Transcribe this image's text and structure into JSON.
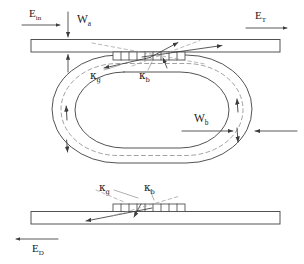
{
  "figure": {
    "kind": "optical-ring-resonator-schematic",
    "stroke_color": "#3c3c3c",
    "fill_color": "#ffffff",
    "background": "#ffffff"
  },
  "labels": {
    "input_field": {
      "base": "E",
      "sub": "in"
    },
    "through_field": {
      "base": "E",
      "sub": "T"
    },
    "drop_field": {
      "base": "E",
      "sub": "D"
    },
    "width_bus": {
      "base": "W",
      "sub": "a"
    },
    "width_ring": {
      "base": "W",
      "sub": "b"
    },
    "kappa_grating_top": {
      "base": "κ",
      "sub": "g"
    },
    "kappa_bus_top": {
      "base": "κ",
      "sub": "b"
    },
    "kappa_grating_bottom": {
      "base": "κ",
      "sub": "g"
    },
    "kappa_bus_bottom": {
      "base": "κ",
      "sub": "b"
    }
  },
  "components": {
    "top_bus_waveguide": "top-bus-waveguide",
    "bottom_bus_waveguide": "bottom-bus-waveguide",
    "ring_resonator": "racetrack-ring-resonator",
    "top_grating": "top-grating-coupler",
    "bottom_grating": "bottom-grating-coupler"
  }
}
